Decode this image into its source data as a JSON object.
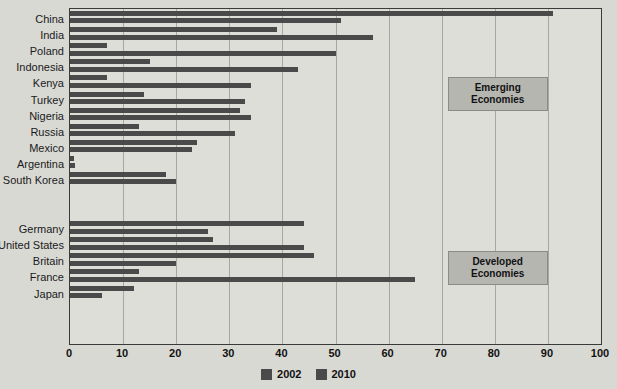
{
  "chart_data": {
    "type": "bar",
    "orientation": "horizontal",
    "title": "",
    "xlabel": "",
    "ylabel": "",
    "xlim": [
      0,
      100
    ],
    "xticks": [
      0,
      10,
      20,
      30,
      40,
      50,
      60,
      70,
      80,
      90,
      100
    ],
    "grid": true,
    "legend_position": "bottom",
    "series": [
      {
        "name": "2002",
        "color": "#4a4a4a",
        "values": [
          91,
          39,
          7,
          15,
          7,
          14,
          32,
          13,
          24,
          0.7,
          18,
          44,
          27,
          46,
          13,
          12
        ]
      },
      {
        "name": "2010",
        "color": "#4a4a4a",
        "values": [
          51,
          57,
          50,
          43,
          34,
          33,
          34,
          31,
          23,
          1,
          20,
          26,
          44,
          20,
          65,
          6
        ]
      }
    ],
    "categories": [
      "China",
      "India",
      "Poland",
      "Indonesia",
      "Kenya",
      "Turkey",
      "Nigeria",
      "Russia",
      "Mexico",
      "Argentina",
      "South Korea",
      "Germany",
      "United States",
      "Britain",
      "France",
      "Japan"
    ],
    "groups": [
      {
        "label": "Emerging Economies",
        "categories": [
          "China",
          "India",
          "Poland",
          "Indonesia",
          "Kenya",
          "Turkey",
          "Nigeria",
          "Russia",
          "Mexico",
          "Argentina",
          "South Korea"
        ]
      },
      {
        "label": "Developed Economies",
        "categories": [
          "Germany",
          "United States",
          "Britain",
          "France",
          "Japan"
        ]
      }
    ],
    "annotations": [
      {
        "text_line1": "Emerging",
        "text_line2": "Economies"
      },
      {
        "text_line1": "Developed",
        "text_line2": "Economies"
      }
    ]
  },
  "axis": {
    "ticks": [
      "0",
      "10",
      "20",
      "30",
      "40",
      "50",
      "60",
      "70",
      "80",
      "90",
      "100"
    ]
  },
  "legend": {
    "items": [
      {
        "label": "2002",
        "color": "#4a4a4a"
      },
      {
        "label": "2010",
        "color": "#4a4a4a"
      }
    ]
  },
  "labels": {
    "rows": [
      "China",
      "India",
      "Poland",
      "Indonesia",
      "Kenya",
      "Turkey",
      "Nigeria",
      "Russia",
      "Mexico",
      "Argentina",
      "South Korea",
      "Germany",
      "United States",
      "Britain",
      "France",
      "Japan"
    ]
  },
  "annotations": {
    "emerging": {
      "line1": "Emerging",
      "line2": "Economies"
    },
    "developed": {
      "line1": "Developed",
      "line2": "Economies"
    }
  },
  "colors": {
    "page_background": "#d9d9d4",
    "plot_background": "#dedeD9",
    "bar": "#4a4a4a",
    "gridline": "#a8a8a2",
    "frame": "#3a3a3a",
    "annotation_box": "#b6b6b1"
  }
}
